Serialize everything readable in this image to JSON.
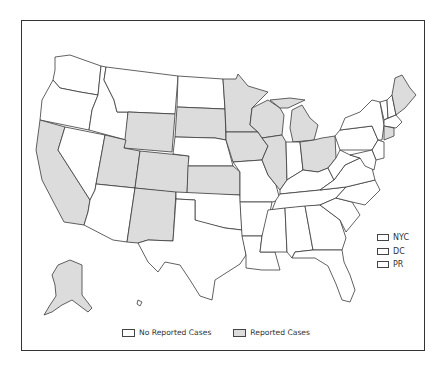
{
  "map": {
    "title": "",
    "colors": {
      "reported": "#dcdcdc",
      "no_reported": "#ffffff",
      "border": "#3a3a3a"
    },
    "reported_states": [
      "WA-no"
    ],
    "states": {
      "WA": "no",
      "OR": "no",
      "CA": "reported",
      "NV": "no",
      "ID": "no",
      "MT": "no",
      "WY": "reported",
      "UT": "reported",
      "AZ": "no",
      "CO": "reported",
      "NM": "reported",
      "ND": "no",
      "SD": "reported",
      "NE": "no",
      "KS": "reported",
      "OK": "no",
      "TX": "no",
      "MN": "reported",
      "IA": "reported",
      "MO": "no",
      "AR": "no",
      "LA": "no",
      "WI": "reported",
      "IL": "reported",
      "MI": "reported",
      "IN": "no",
      "OH": "reported",
      "KY": "no",
      "TN": "no",
      "MS": "no",
      "AL": "no",
      "GA": "no",
      "FL": "no",
      "SC": "no",
      "NC": "no",
      "VA": "no",
      "WV": "no",
      "PA": "no",
      "NY": "no",
      "VT": "no",
      "NH": "no",
      "ME": "reported",
      "MA": "no",
      "RI": "no",
      "CT": "reported",
      "NJ": "no",
      "DE": "no",
      "MD": "no",
      "AK": "reported",
      "HI": "no"
    }
  },
  "side_legend": [
    {
      "label": "NYC",
      "status": "no"
    },
    {
      "label": "DC",
      "status": "no"
    },
    {
      "label": "PR",
      "status": "no"
    }
  ],
  "legend": [
    {
      "label": "No Reported Cases",
      "color": "#ffffff"
    },
    {
      "label": "Reported Cases",
      "color": "#dcdcdc"
    }
  ]
}
